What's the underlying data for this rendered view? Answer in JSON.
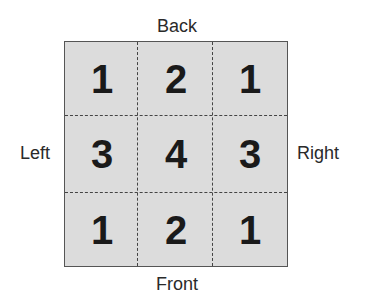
{
  "labels": {
    "back": "Back",
    "front": "Front",
    "left": "Left",
    "right": "Right"
  },
  "grid": {
    "rows": [
      [
        "1",
        "2",
        "1"
      ],
      [
        "3",
        "4",
        "3"
      ],
      [
        "1",
        "2",
        "1"
      ]
    ]
  },
  "colors": {
    "cell_fill": "#dcdcdc",
    "border": "#555555",
    "text": "#1a1a1a"
  }
}
